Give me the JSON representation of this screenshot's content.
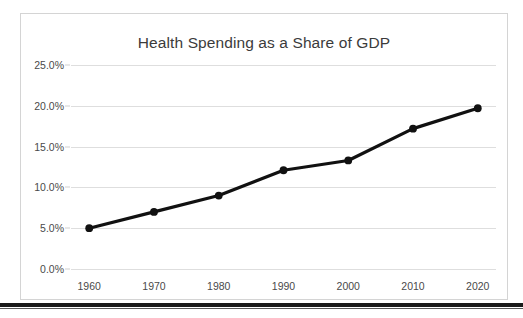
{
  "chart_data": {
    "type": "line",
    "title": "Health Spending as a Share of GDP",
    "xlabel": "",
    "ylabel": "",
    "categories": [
      "1960",
      "1970",
      "1980",
      "1990",
      "2000",
      "2010",
      "2020"
    ],
    "x": [
      1960,
      1970,
      1980,
      1990,
      2000,
      2010,
      2020
    ],
    "values": [
      5.0,
      7.0,
      9.0,
      12.1,
      13.3,
      17.2,
      19.7
    ],
    "value_labels": [
      "5.0%",
      "7.0%",
      "9.0%",
      "12.1%",
      "13.3%",
      "17.2%",
      "19.7%"
    ],
    "ylim": [
      0,
      25
    ],
    "ytick_values": [
      0,
      5,
      10,
      15,
      20,
      25
    ],
    "ytick_labels": [
      "0.0%",
      "5.0%",
      "10.0%",
      "15.0%",
      "20.0%",
      "25.0%"
    ],
    "grid": true,
    "legend": false,
    "legend_position": "none",
    "series_color": "#111111",
    "marker": "circle",
    "marker_color": "#111111",
    "gridline_color": "#dedede",
    "axis_text_color": "#4a4a4a",
    "title_color": "#3b3b3b",
    "background_color": "#ffffff",
    "border_color": "#d4d4d4"
  }
}
